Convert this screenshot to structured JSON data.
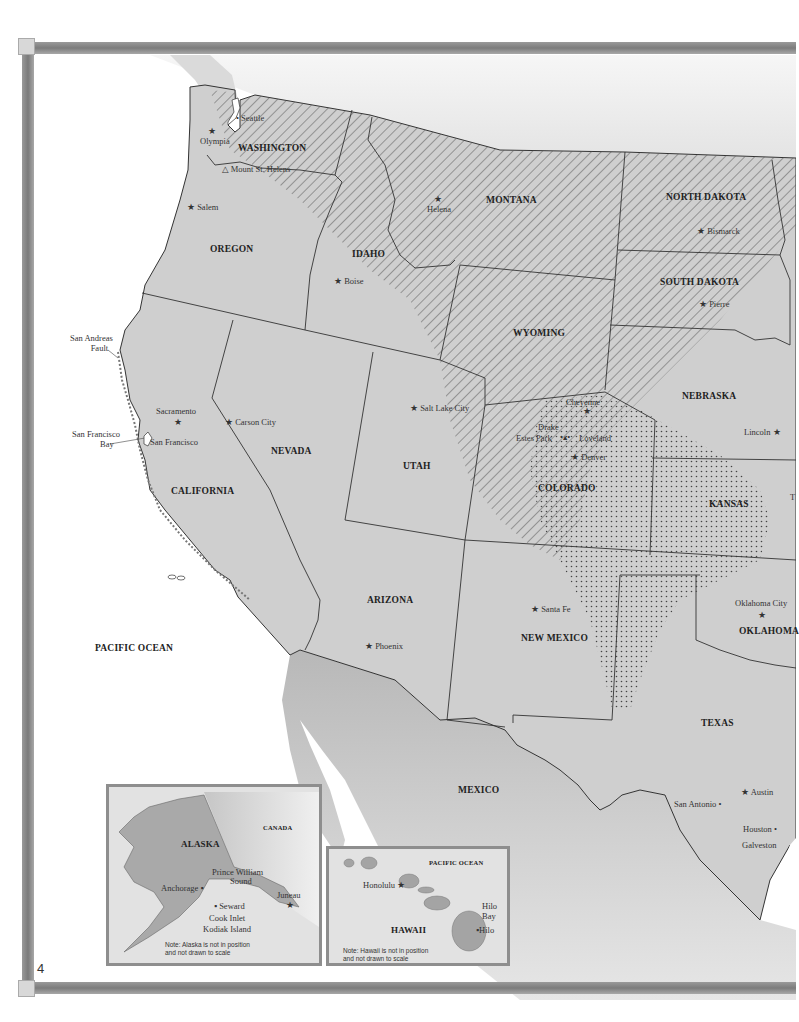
{
  "page": {
    "number": "4"
  },
  "map": {
    "title": "Western United States",
    "colors": {
      "land": "#cfcfcf",
      "water": "#ffffff",
      "frame": "#8a8a8a",
      "border": "#333333",
      "mexico": "#c4c4c4"
    },
    "legend_patterns": {
      "diagonal_hatch": "northern region hatching",
      "dot_stipple": "central plains stippling"
    },
    "states": {
      "washington": "WASHINGTON",
      "oregon": "OREGON",
      "idaho": "IDAHO",
      "montana": "MONTANA",
      "north_dakota": "NORTH DAKOTA",
      "south_dakota": "SOUTH DAKOTA",
      "wyoming": "WYOMING",
      "nebraska": "NEBRASKA",
      "nevada": "NEVADA",
      "utah": "UTAH",
      "colorado": "COLORADO",
      "kansas": "KANSAS",
      "california": "CALIFORNIA",
      "arizona": "ARIZONA",
      "new_mexico": "NEW MEXICO",
      "oklahoma": "OKLAHOMA",
      "texas": "TEXAS"
    },
    "regions": {
      "pacific_ocean": "PACIFIC OCEAN",
      "mexico": "MEXICO"
    },
    "features": {
      "mount_st_helens": "Mount St. Helens",
      "san_andreas": "San Andreas\nFault",
      "san_andreas_l1": "San Andreas",
      "san_andreas_l2": "Fault",
      "sf_bay_l1": "San Francisco",
      "sf_bay_l2": "Bay"
    },
    "cities": {
      "seattle": "Seattle",
      "olympia": "Olympia",
      "salem": "Salem",
      "helena": "Helena",
      "bismarck": "Bismarck",
      "pierre": "Pierre",
      "boise": "Boise",
      "sacramento": "Sacramento",
      "san_francisco": "San Francisco",
      "carson_city": "Carson City",
      "salt_lake_city": "Salt Lake City",
      "cheyenne": "Cheyenne",
      "drake": "Drake",
      "estes_park": "Estes Park",
      "loveland": "Loveland",
      "denver": "Denver",
      "lincoln": "Lincoln",
      "santa_fe": "Santa Fe",
      "phoenix": "Phoenix",
      "oklahoma_city": "Oklahoma City",
      "austin": "Austin",
      "san_antonio": "San Antonio",
      "houston": "Houston",
      "galveston": "Galveston",
      "texas_cut": "T"
    }
  },
  "alaska_inset": {
    "state": "ALASKA",
    "canada": "CANADA",
    "anchorage": "Anchorage",
    "pws_l1": "Prince William",
    "pws_l2": "Sound",
    "juneau": "Juneau",
    "seward": "Seward",
    "cook_inlet": "Cook Inlet",
    "kodiak": "Kodiak Island",
    "note_l1": "Note: Alaska is not in position",
    "note_l2": "and not drawn to scale"
  },
  "hawaii_inset": {
    "state": "HAWAII",
    "ocean": "PACIFIC OCEAN",
    "honolulu": "Honolulu",
    "hilo_bay_l1": "Hilo",
    "hilo_bay_l2": "Bay",
    "hilo": "Hilo",
    "note_l1": "Note: Hawaii is not in position",
    "note_l2": "and not drawn to scale"
  }
}
